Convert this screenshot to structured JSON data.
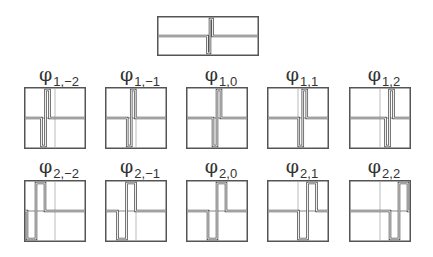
{
  "diagram": {
    "type": "wavelet-basis-functions",
    "top": {
      "name": "mother-wavelet",
      "box": {
        "x": 157,
        "y": 16,
        "w": 102,
        "h": 40
      }
    },
    "colors": {
      "stroke": "#555555",
      "grid": "#8a8a8a",
      "background": "#ffffff",
      "text": "#333333"
    },
    "symbol": "φ",
    "rows": [
      {
        "scale": 1,
        "y": 87,
        "label_y": 64,
        "step": 4.75,
        "half_width": 4,
        "items": [
          {
            "j": 1,
            "k": -2,
            "sub": "1,−2",
            "x": 24
          },
          {
            "j": 1,
            "k": -1,
            "sub": "1,−1",
            "x": 105
          },
          {
            "j": 1,
            "k": 0,
            "sub": "1,0",
            "x": 186
          },
          {
            "j": 1,
            "k": 1,
            "sub": "1,1",
            "x": 267
          },
          {
            "j": 1,
            "k": 2,
            "sub": "1,2",
            "x": 349
          }
        ]
      },
      {
        "scale": 2,
        "y": 180,
        "label_y": 156,
        "step": 9.5,
        "half_width": 9,
        "items": [
          {
            "j": 2,
            "k": -2,
            "sub": "2,−2",
            "x": 24
          },
          {
            "j": 2,
            "k": -1,
            "sub": "2,−1",
            "x": 105
          },
          {
            "j": 2,
            "k": 0,
            "sub": "2,0",
            "x": 186
          },
          {
            "j": 2,
            "k": 1,
            "sub": "2,1",
            "x": 267
          },
          {
            "j": 2,
            "k": 2,
            "sub": "2,2",
            "x": 349
          }
        ]
      }
    ]
  }
}
